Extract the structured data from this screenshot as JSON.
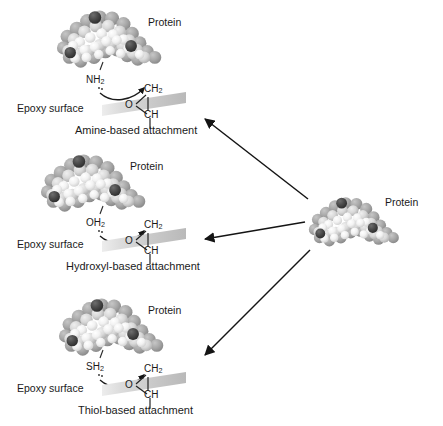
{
  "figure": {
    "background_color": "#ffffff",
    "ink_color": "#1a1a1a",
    "slab_color_light": "#e3e3e3",
    "slab_color_dark": "#b4b4b4"
  },
  "labels": {
    "protein": "Protein",
    "epoxy_surface": "Epoxy surface",
    "ch2": "CH",
    "ch2_sub": "2",
    "ch": "CH",
    "oxygen": "O"
  },
  "panels": [
    {
      "id": "amine",
      "protein_label": "Protein",
      "functional_group": "NH",
      "functional_group_sub": "2",
      "surface_label": "Epoxy surface",
      "caption": "Amine-based attachment",
      "epoxide_top": "CH",
      "epoxide_top_sub": "2",
      "epoxide_bottom": "CH",
      "epoxide_oxygen": "O"
    },
    {
      "id": "hydroxyl",
      "protein_label": "Protein",
      "functional_group": "OH",
      "functional_group_sub": "2",
      "surface_label": "Epoxy surface",
      "caption": "Hydroxyl-based attachment",
      "epoxide_top": "CH",
      "epoxide_top_sub": "2",
      "epoxide_bottom": "CH",
      "epoxide_oxygen": "O"
    },
    {
      "id": "thiol",
      "protein_label": "Protein",
      "functional_group": "SH",
      "functional_group_sub": "2",
      "surface_label": "Epoxy surface",
      "caption": "Thiol-based attachment",
      "epoxide_top": "CH",
      "epoxide_top_sub": "2",
      "epoxide_bottom": "CH",
      "epoxide_oxygen": "O"
    }
  ],
  "source": {
    "protein_label": "Protein"
  },
  "arrows": [
    {
      "name": "arrow-to-amine",
      "from": [
        308,
        199
      ],
      "to": [
        203,
        118
      ]
    },
    {
      "name": "arrow-to-hydroxyl",
      "from": [
        305,
        222
      ],
      "to": [
        203,
        240
      ]
    },
    {
      "name": "arrow-to-thiol",
      "from": [
        310,
        250
      ],
      "to": [
        203,
        357
      ]
    }
  ]
}
